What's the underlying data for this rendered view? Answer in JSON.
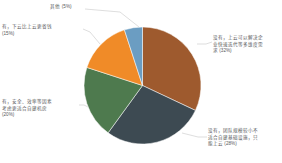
{
  "chart_data": {
    "type": "pie",
    "title": "",
    "subtitle": "",
    "xlabel": "",
    "ylabel": "",
    "legend_position": "none",
    "grid": false,
    "labels_outside": true,
    "leader_lines": true,
    "categories": [
      "没有，上云可以解决企业快速迭代等多维度需求",
      "没有，团队规模较小不适合自建基础设施，只能上云",
      "有，安全、效率等因素考虑更适合自建机房",
      "有，下云比上云更省钱",
      "其他"
    ],
    "values": [
      32,
      28,
      20,
      15,
      5
    ],
    "value_unit": "%",
    "colors": [
      "#9e5a2e",
      "#3d4a52",
      "#4e7a4e",
      "#f08b28",
      "#6b9dc2"
    ],
    "slices": [
      {
        "name": "没有，上云可以解决企业快速迭代等多维度需求",
        "value": 32,
        "percent_text": "(32%)",
        "color": "#9e5a2e",
        "label_text": "没有，上云可以解决企业快速迭代等多维度需求 (32%)"
      },
      {
        "name": "没有，团队规模较小不适合自建基础设施，只能上云",
        "value": 28,
        "percent_text": "(28%)",
        "color": "#3d4a52",
        "label_text": "没有，团队规模较小不适合自建基础设施，只能上云 (28%)"
      },
      {
        "name": "有，安全、效率等因素考虑更适合自建机房",
        "value": 20,
        "percent_text": "(20%)",
        "color": "#4e7a4e",
        "label_text": "有，安全、效率等因素考虑更适合自建机房 (20%)"
      },
      {
        "name": "有，下云比上云更省钱",
        "value": 15,
        "percent_text": "(15%)",
        "color": "#f08b28",
        "label_text": "有，下云比上云更省钱 (15%)"
      },
      {
        "name": "其他",
        "value": 5,
        "percent_text": "(5%)",
        "color": "#6b9dc2",
        "label_text": "其他 (5%)"
      }
    ]
  },
  "labels": {
    "nocloud_fast": "没有，上云可以解决企\n业快速迭代等多维度需\n求 (32%)",
    "nocloud_smallteam": "没有，团队规模较小不\n适合自建基础设施，只\n能上云 (28%)",
    "yes_selfbuild": "有，安全、效率等因素\n考虑更适合自建机房\n(20%)",
    "yes_cheaper": "有，下云比上云更省钱\n(15%)",
    "other": "其他 (5%)"
  },
  "style": {
    "background": "#ffffff",
    "label_color": "#58585a",
    "leader_line_color": "#c8c8c8"
  }
}
